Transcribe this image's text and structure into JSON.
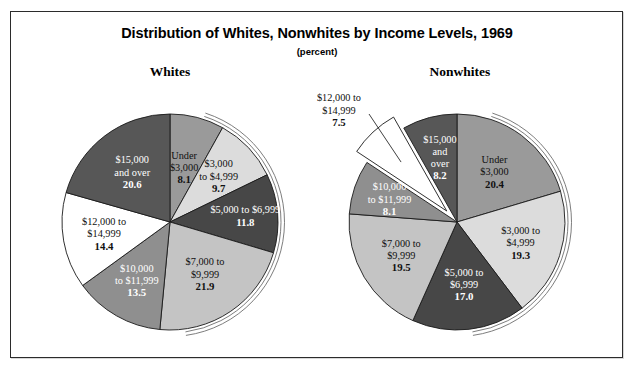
{
  "figure": {
    "title": "Distribution of Whites, Nonwhites by Income Levels, 1969",
    "subtitle": "(percent)",
    "frame_color": "#2b2b2b",
    "background": "#ffffff"
  },
  "panels": [
    {
      "heading": "Whites"
    },
    {
      "heading": "Nonwhites"
    }
  ],
  "chart_data": [
    {
      "type": "pie",
      "title": "Whites",
      "subtitle": "(percent)",
      "units": "percent",
      "start_angle_deg": 0,
      "direction": "clockwise",
      "legend": "none (labels drawn inside slices)",
      "categories": [
        "Under $3,000",
        "$3,000 to $4,999",
        "$5,000 to $6,999",
        "$7,000 to $9,999",
        "$10,000 to $11,999",
        "$12,000 to $14,999",
        "$15,000 and over"
      ],
      "values": [
        8.1,
        9.7,
        11.8,
        21.9,
        13.5,
        14.4,
        20.6
      ],
      "total": 100.0,
      "slice_colors": [
        "#9a9a9a",
        "#dcdcdc",
        "#474747",
        "#c4c4c4",
        "#8f8f8f",
        "#ffffff",
        "#575757"
      ],
      "label_text_colors": [
        "#101010",
        "#101010",
        "#ffffff",
        "#101010",
        "#ffffff",
        "#101010",
        "#ffffff"
      ],
      "labels": [
        {
          "lines": [
            "Under",
            "$3,000"
          ],
          "value": "8.1"
        },
        {
          "lines": [
            "$3,000",
            "to $4,999"
          ],
          "value": "9.7"
        },
        {
          "lines": [
            "$5,000 to $6,999"
          ],
          "value": "11.8"
        },
        {
          "lines": [
            "$7,000 to",
            "$9,999"
          ],
          "value": "21.9"
        },
        {
          "lines": [
            "$10,000",
            "to $11,999"
          ],
          "value": "13.5"
        },
        {
          "lines": [
            "$12,000 to",
            "$14,999"
          ],
          "value": "14.4"
        },
        {
          "lines": [
            "$15,000",
            "and over"
          ],
          "value": "20.6"
        }
      ]
    },
    {
      "type": "pie",
      "title": "Nonwhites",
      "subtitle": "(percent)",
      "units": "percent",
      "start_angle_deg": 0,
      "direction": "clockwise",
      "legend": "none (labels drawn inside slices)",
      "exploded_slice": "$12,000 to $14,999",
      "categories": [
        "Under $3,000",
        "$3,000 to $4,999",
        "$5,000 to $6,999",
        "$7,000 to $9,999",
        "$10,000 to $11,999",
        "$12,000 to $14,999",
        "$15,000 and over"
      ],
      "values": [
        20.4,
        19.3,
        17.0,
        19.5,
        8.1,
        7.5,
        8.2
      ],
      "total": 100.0,
      "slice_colors": [
        "#9a9a9a",
        "#dcdcdc",
        "#474747",
        "#c4c4c4",
        "#8f8f8f",
        "#ffffff",
        "#575757"
      ],
      "label_text_colors": [
        "#101010",
        "#101010",
        "#ffffff",
        "#101010",
        "#ffffff",
        "#101010",
        "#ffffff"
      ],
      "labels": [
        {
          "lines": [
            "Under",
            "$3,000"
          ],
          "value": "20.4"
        },
        {
          "lines": [
            "$3,000 to",
            "$4,999"
          ],
          "value": "19.3"
        },
        {
          "lines": [
            "$5,000 to",
            "$6,999"
          ],
          "value": "17.0"
        },
        {
          "lines": [
            "$7,000 to",
            "$9,999"
          ],
          "value": "19.5"
        },
        {
          "lines": [
            "$10,000",
            "to $11,999"
          ],
          "value": "8.1"
        },
        {
          "lines": [
            "$12,000 to",
            "$14,999"
          ],
          "value": "7.5"
        },
        {
          "lines": [
            "$15,000",
            "and",
            "over"
          ],
          "value": "8.2"
        }
      ]
    }
  ]
}
